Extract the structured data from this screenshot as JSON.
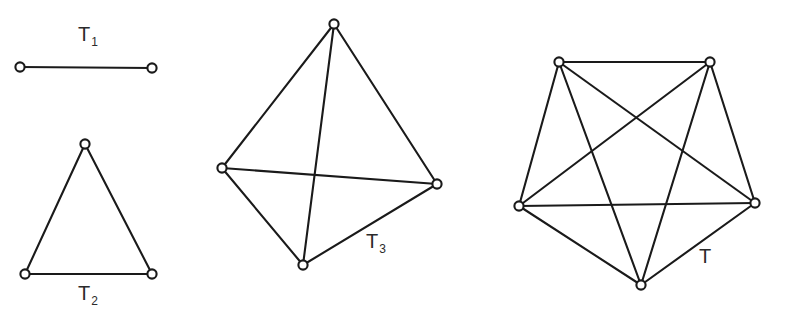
{
  "figure": {
    "background_color": "#ffffff",
    "line_color": "#1a1a1a",
    "label_color": "#2b2b2b",
    "width": 785,
    "height": 316
  },
  "chart_data": {
    "type": "diagram",
    "subtype": "node-link-graph-series",
    "xlabel": "",
    "ylabel": "",
    "grid": false,
    "legend": "none",
    "axis_ranges": {
      "x": [
        0,
        785
      ],
      "y": [
        0,
        316
      ]
    },
    "graphs": [
      {
        "name": "T1",
        "label_text": "T",
        "label_sub": "1",
        "label_x": 78,
        "label_y": 24,
        "node_count": 2,
        "edge_count": 1,
        "complete": true,
        "nodes": [
          {
            "id": "a",
            "x": 20,
            "y": 67
          },
          {
            "id": "b",
            "x": 152,
            "y": 68
          }
        ],
        "edges": [
          [
            "a",
            "b"
          ]
        ]
      },
      {
        "name": "T2",
        "label_text": "T",
        "label_sub": "2",
        "label_x": 78,
        "label_y": 283,
        "node_count": 3,
        "edge_count": 3,
        "complete": true,
        "nodes": [
          {
            "id": "a",
            "x": 85,
            "y": 144
          },
          {
            "id": "b",
            "x": 25,
            "y": 274
          },
          {
            "id": "c",
            "x": 152,
            "y": 274
          }
        ],
        "edges": [
          [
            "a",
            "b"
          ],
          [
            "a",
            "c"
          ],
          [
            "b",
            "c"
          ]
        ]
      },
      {
        "name": "T3",
        "label_text": "T",
        "label_sub": "3",
        "label_x": 366,
        "label_y": 231,
        "node_count": 4,
        "edge_count": 6,
        "complete": true,
        "nodes": [
          {
            "id": "a",
            "x": 334,
            "y": 24
          },
          {
            "id": "b",
            "x": 222,
            "y": 168
          },
          {
            "id": "c",
            "x": 437,
            "y": 184
          },
          {
            "id": "d",
            "x": 303,
            "y": 265
          }
        ],
        "edges": [
          [
            "a",
            "b"
          ],
          [
            "a",
            "c"
          ],
          [
            "a",
            "d"
          ],
          [
            "b",
            "c"
          ],
          [
            "b",
            "d"
          ],
          [
            "c",
            "d"
          ]
        ]
      },
      {
        "name": "T",
        "label_text": "T",
        "label_sub": "",
        "label_x": 699,
        "label_y": 246,
        "node_count": 5,
        "edge_count": 10,
        "complete": true,
        "nodes": [
          {
            "id": "a",
            "x": 559,
            "y": 62
          },
          {
            "id": "b",
            "x": 710,
            "y": 62
          },
          {
            "id": "c",
            "x": 519,
            "y": 206
          },
          {
            "id": "d",
            "x": 755,
            "y": 203
          },
          {
            "id": "e",
            "x": 641,
            "y": 285
          }
        ],
        "edges": [
          [
            "a",
            "b"
          ],
          [
            "a",
            "c"
          ],
          [
            "a",
            "d"
          ],
          [
            "a",
            "e"
          ],
          [
            "b",
            "c"
          ],
          [
            "b",
            "d"
          ],
          [
            "b",
            "e"
          ],
          [
            "c",
            "d"
          ],
          [
            "c",
            "e"
          ],
          [
            "d",
            "e"
          ]
        ]
      }
    ],
    "node_radius": 4.6
  }
}
